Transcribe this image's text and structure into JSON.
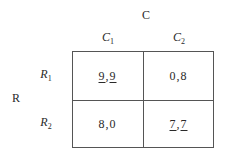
{
  "players": {
    "column": "C",
    "row": "R"
  },
  "columns": [
    {
      "base": "C",
      "sub": "1"
    },
    {
      "base": "C",
      "sub": "2"
    }
  ],
  "rows": [
    {
      "base": "R",
      "sub": "1"
    },
    {
      "base": "R",
      "sub": "2"
    }
  ],
  "payoffs": [
    [
      {
        "r": "9",
        "sep": ",",
        "c": "9",
        "r_best": true,
        "c_best": true
      },
      {
        "r": "0",
        "sep": ",",
        "c": "8",
        "r_best": false,
        "c_best": false
      }
    ],
    [
      {
        "r": "8",
        "sep": ",",
        "c": "0",
        "r_best": false,
        "c_best": false
      },
      {
        "r": "7",
        "sep": ",",
        "c": "7",
        "r_best": true,
        "c_best": true
      }
    ]
  ]
}
